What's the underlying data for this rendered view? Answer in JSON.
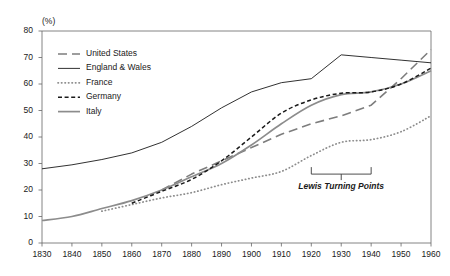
{
  "chart_data": {
    "type": "line",
    "title": "",
    "subtitle": "",
    "xlabel": "",
    "ylabel": "(%)",
    "unit_label": "(%)",
    "xlim": [
      1830,
      1960
    ],
    "ylim": [
      0,
      80
    ],
    "grid": false,
    "legend_position": "top-left inside plot",
    "xticks": [
      1830,
      1840,
      1850,
      1860,
      1870,
      1880,
      1890,
      1900,
      1910,
      1920,
      1930,
      1940,
      1950,
      1960
    ],
    "xtick_labels": [
      "1830",
      "1840",
      "1850",
      "1860",
      "1870",
      "1880",
      "1890",
      "1900",
      "1910",
      "1920",
      "1930",
      "1940",
      "1950",
      "1960"
    ],
    "yticks": [
      0,
      10,
      20,
      30,
      40,
      50,
      60,
      70,
      80
    ],
    "ytick_labels": [
      "0",
      "10",
      "20",
      "30",
      "40",
      "50",
      "60",
      "70",
      "80"
    ],
    "series": [
      {
        "name": "United States",
        "style": "long-dash",
        "color": "#7d7d7d",
        "x": [
          1870,
          1880,
          1890,
          1900,
          1910,
          1920,
          1930,
          1940,
          1950,
          1960
        ],
        "values": [
          20,
          26,
          31,
          36,
          41,
          45,
          48,
          52,
          62,
          73
        ]
      },
      {
        "name": "England & Wales",
        "style": "solid-thin",
        "color": "#1a1a1a",
        "x": [
          1830,
          1840,
          1850,
          1860,
          1870,
          1880,
          1890,
          1900,
          1910,
          1920,
          1930,
          1940,
          1950,
          1960
        ],
        "values": [
          28,
          29.5,
          31.5,
          34,
          38,
          44,
          51,
          57,
          60.5,
          62,
          71,
          70,
          69,
          68
        ]
      },
      {
        "name": "France",
        "style": "dotted",
        "color": "#8c8c8c",
        "x": [
          1850,
          1860,
          1870,
          1880,
          1890,
          1900,
          1910,
          1920,
          1930,
          1940,
          1950,
          1960
        ],
        "values": [
          12,
          14.5,
          17,
          19,
          22,
          24.5,
          27,
          33,
          38,
          39,
          42,
          48
        ]
      },
      {
        "name": "Germany",
        "style": "short-dash",
        "color": "#1a1a1a",
        "x": [
          1860,
          1870,
          1880,
          1890,
          1900,
          1910,
          1920,
          1930,
          1940,
          1950,
          1960
        ],
        "values": [
          15,
          19.5,
          24,
          31,
          40,
          49,
          54,
          56.5,
          57,
          60,
          66
        ]
      },
      {
        "name": "Italy",
        "style": "solid-medium",
        "color": "#8c8c8c",
        "x": [
          1830,
          1840,
          1850,
          1860,
          1870,
          1880,
          1890,
          1900,
          1910,
          1920,
          1930,
          1940,
          1950,
          1960
        ],
        "values": [
          8.5,
          10,
          13,
          16,
          20,
          25,
          30,
          37,
          45,
          52,
          56,
          57,
          60,
          65
        ]
      }
    ],
    "annotations": [
      {
        "text": "Lewis Turning Points",
        "type": "bracket",
        "x_start": 1920,
        "x_end": 1940,
        "y": 26,
        "label_y": 21
      }
    ]
  },
  "legend": {
    "entries": [
      {
        "label": "United States"
      },
      {
        "label": "England & Wales"
      },
      {
        "label": "France"
      },
      {
        "label": "Germany"
      },
      {
        "label": "Italy"
      }
    ]
  }
}
